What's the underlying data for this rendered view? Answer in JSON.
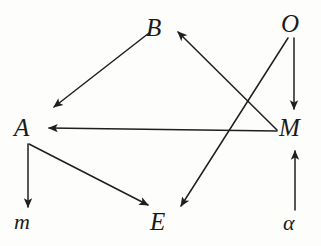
{
  "figure": {
    "kind": "directed-graph",
    "background_color": "#fdfdfc",
    "stroke_color": "#1f1f1f",
    "label_color": "#1a1a1a"
  },
  "nodes": [
    {
      "id": "B",
      "label": "B",
      "x": 159,
      "y": 27,
      "style": "capital-italic"
    },
    {
      "id": "O",
      "label": "O",
      "x": 294,
      "y": 23,
      "style": "capital-italic"
    },
    {
      "id": "A",
      "label": "A",
      "x": 27,
      "y": 127,
      "style": "capital-italic"
    },
    {
      "id": "M",
      "label": "M",
      "x": 294,
      "y": 127,
      "style": "capital-italic"
    },
    {
      "id": "m",
      "label": "m",
      "x": 28,
      "y": 222,
      "style": "lowercase-italic"
    },
    {
      "id": "E",
      "label": "E",
      "x": 163,
      "y": 221,
      "style": "capital-italic"
    },
    {
      "id": "alpha",
      "label": "α",
      "x": 295,
      "y": 223,
      "style": "lowercase-italic"
    }
  ],
  "edges": [
    {
      "id": "B-to-A",
      "from": "B",
      "to": "A",
      "x1": 149,
      "y1": 33,
      "x2": 54,
      "y2": 107,
      "arrow": "end"
    },
    {
      "id": "M-to-B",
      "from": "M",
      "to": "B",
      "x1": 277,
      "y1": 130,
      "x2": 178,
      "y2": 32,
      "arrow": "end"
    },
    {
      "id": "M-to-A",
      "from": "M",
      "to": "A",
      "x1": 277,
      "y1": 131,
      "x2": 49,
      "y2": 128,
      "arrow": "end"
    },
    {
      "id": "O-to-M",
      "from": "O",
      "to": "M",
      "x1": 294,
      "y1": 38,
      "x2": 294,
      "y2": 109,
      "arrow": "end"
    },
    {
      "id": "O-to-E",
      "from": "O",
      "to": "E",
      "x1": 288,
      "y1": 38,
      "x2": 181,
      "y2": 206,
      "arrow": "end"
    },
    {
      "id": "A-to-m",
      "from": "A",
      "to": "m",
      "x1": 28,
      "y1": 144,
      "x2": 28,
      "y2": 207,
      "arrow": "end"
    },
    {
      "id": "A-to-E",
      "from": "A",
      "to": "E",
      "x1": 29,
      "y1": 144,
      "x2": 148,
      "y2": 205,
      "arrow": "end"
    },
    {
      "id": "alpha-to-M",
      "from": "alpha",
      "to": "M",
      "x1": 295,
      "y1": 210,
      "x2": 295,
      "y2": 151,
      "arrow": "end"
    }
  ]
}
